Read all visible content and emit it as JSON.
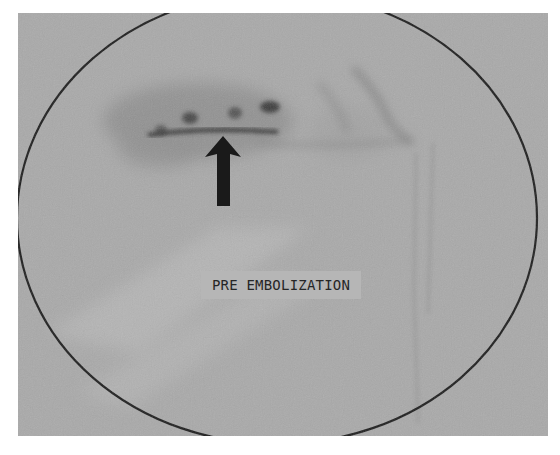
{
  "image": {
    "kind": "angiogram (fluoroscopic)",
    "label": "PRE EMBOLIZATION",
    "annotation": {
      "type": "arrow",
      "direction": "up",
      "points_to": "contrast blush / bleeding site"
    },
    "colors": {
      "background_field": "#a9a9a9",
      "border": "#ffffff",
      "collimator_outline": "#1e1e1e",
      "arrow": "#1a1a1a",
      "label_text": "#262626"
    }
  }
}
